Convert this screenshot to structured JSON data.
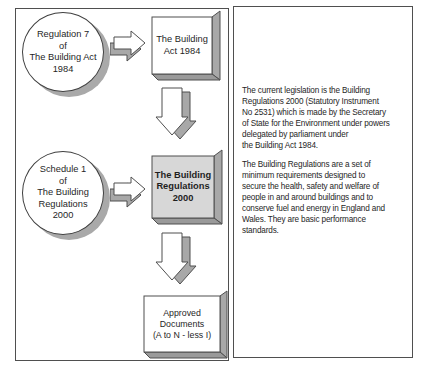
{
  "colors": {
    "outline": "#4f4f4f",
    "shape_outline": "#3f3f3f",
    "shadow_gray": "#a9a9a9",
    "side_gray": "#a8a8a8",
    "box2_face": "#d7d7d7",
    "background": "#ffffff",
    "text": "#262626"
  },
  "flowchart": {
    "ellipse_regulation7": "Regulation 7\nof\nThe Building Act\n1984",
    "box_building_act": "The Building\nAct 1984",
    "ellipse_schedule1": "Schedule 1\nof\nThe Building\nRegulations\n2000",
    "box_building_regulations": "The Building\nRegulations\n2000",
    "box_approved_documents": "Approved\nDocuments\n(A to N - less I)"
  },
  "info_panel": {
    "paragraph1": "The current legislation is the Building\nRegulations 2000 (Statutory Instrument\nNo 2531) which is made by the Secretary\nof State for the Environment under powers\ndelegated by parliament under\nthe Building Act 1984.",
    "paragraph2": "The Building Regulations are a set of\nminimum requirements designed to\nsecure the health, safety and welfare of\npeople in and around buildings and to\nconserve fuel and energy in England and\nWales. They are basic performance\nstandards."
  }
}
